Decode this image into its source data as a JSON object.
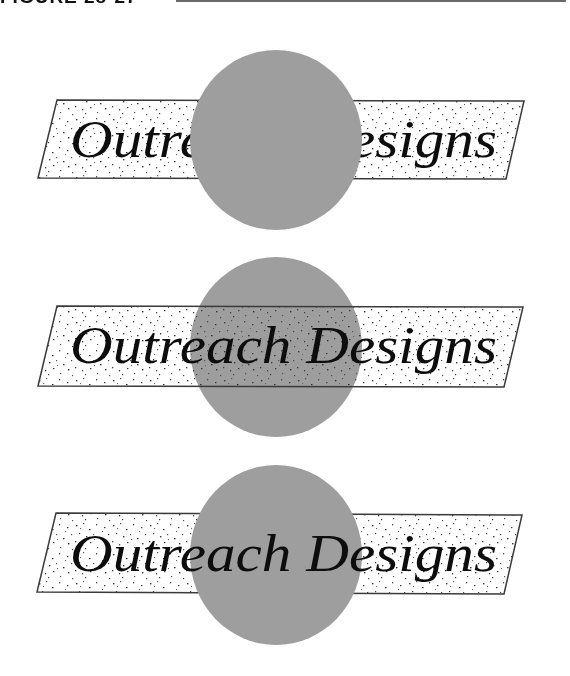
{
  "figure": {
    "label": "FIGURE 28-27"
  },
  "colors": {
    "circle": "#9e9e9e",
    "band_fill": "#ffffff",
    "band_outline": "#3a3a3a",
    "speckle": "#3c3c3c",
    "text": "#0d0d0d",
    "rule": "#6a6a6a"
  },
  "logos": [
    {
      "variant": "circle-on-top-hides-text",
      "text": "Outreach Designs"
    },
    {
      "variant": "band-transparent-over-circle",
      "text": "Outreach Designs"
    },
    {
      "variant": "circle-over-band-text-on-top",
      "text": "Outreach Designs"
    }
  ]
}
